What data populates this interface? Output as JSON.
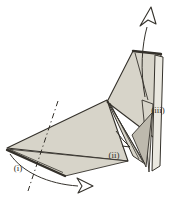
{
  "diagram": {
    "type": "origami-fold-step-illustration",
    "labels": {
      "i": "(i)",
      "ii": "(ii)",
      "iii": "(iii)"
    },
    "icons": [
      "pull-up-arrow-icon",
      "sweep-right-arrow-icon",
      "small-fold-arrow-icon"
    ],
    "colors": {
      "background": "#ffffff",
      "paper": "#d7d4c9",
      "paper_shadow": "#bdb9ad",
      "paper_light": "#eae8e0",
      "line": "#34312b"
    }
  }
}
